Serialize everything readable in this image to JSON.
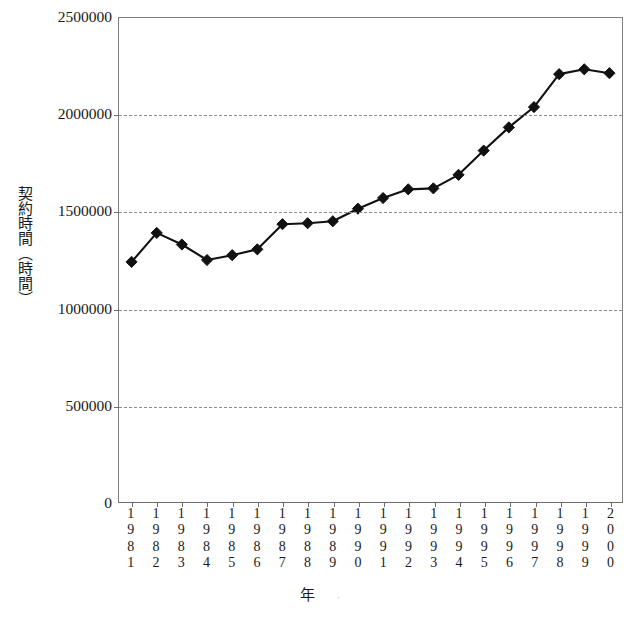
{
  "chart_data": {
    "type": "line",
    "title": "",
    "xlabel": "年",
    "ylabel": "契約時間（時間）",
    "categories": [
      "1981",
      "1982",
      "1983",
      "1984",
      "1985",
      "1986",
      "1987",
      "1988",
      "1989",
      "1990",
      "1991",
      "1992",
      "1993",
      "1994",
      "1995",
      "1996",
      "1997",
      "1998",
      "1999",
      "2000"
    ],
    "values": [
      1240000,
      1390000,
      1330000,
      1250000,
      1275000,
      1305000,
      1435000,
      1440000,
      1450000,
      1515000,
      1570000,
      1615000,
      1620000,
      1690000,
      1815000,
      1935000,
      2040000,
      2210000,
      2235000,
      2215000
    ],
    "ylim": [
      0,
      2500000
    ],
    "y_ticks": [
      0,
      500000,
      1000000,
      1500000,
      2000000,
      2500000
    ],
    "y_tick_labels": [
      "0",
      "500000",
      "1000000",
      "1500000",
      "2000000",
      "2500000"
    ],
    "gridlines_y": [
      500000,
      1000000,
      1500000,
      2000000
    ],
    "grid": true,
    "legend": "none",
    "marker": "diamond",
    "series_color": "#111111",
    "grid_color": "#8d8d8d",
    "axis_color": "#6f6f6f"
  },
  "x_axis": {
    "title": "年",
    "tick_labels_stacked": [
      [
        "1",
        "9",
        "8",
        "1"
      ],
      [
        "1",
        "9",
        "8",
        "2"
      ],
      [
        "1",
        "9",
        "8",
        "3"
      ],
      [
        "1",
        "9",
        "8",
        "4"
      ],
      [
        "1",
        "9",
        "8",
        "5"
      ],
      [
        "1",
        "9",
        "8",
        "6"
      ],
      [
        "1",
        "9",
        "8",
        "7"
      ],
      [
        "1",
        "9",
        "8",
        "8"
      ],
      [
        "1",
        "9",
        "8",
        "9"
      ],
      [
        "1",
        "9",
        "9",
        "0"
      ],
      [
        "1",
        "9",
        "9",
        "1"
      ],
      [
        "1",
        "9",
        "9",
        "2"
      ],
      [
        "1",
        "9",
        "9",
        "3"
      ],
      [
        "1",
        "9",
        "9",
        "4"
      ],
      [
        "1",
        "9",
        "9",
        "5"
      ],
      [
        "1",
        "9",
        "9",
        "6"
      ],
      [
        "1",
        "9",
        "9",
        "7"
      ],
      [
        "1",
        "9",
        "9",
        "8"
      ],
      [
        "1",
        "9",
        "9",
        "9"
      ],
      [
        "2",
        "0",
        "0",
        "0"
      ]
    ]
  },
  "y_axis": {
    "title": "契約時間（時間）"
  }
}
